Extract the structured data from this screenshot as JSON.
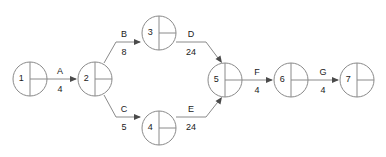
{
  "diagram": {
    "type": "activity-on-arrow-network",
    "colors": {
      "stroke": "#8a8a8a",
      "text": "#1a1a1a",
      "arrow": "#4a4a4a",
      "background": "#ffffff"
    },
    "nodes": [
      {
        "id": "1",
        "label": "1",
        "cx": 30,
        "cy": 79,
        "r": 17
      },
      {
        "id": "2",
        "label": "2",
        "cx": 95,
        "cy": 79,
        "r": 17
      },
      {
        "id": "3",
        "label": "3",
        "cx": 159,
        "cy": 33,
        "r": 17
      },
      {
        "id": "4",
        "label": "4",
        "cx": 159,
        "cy": 128,
        "r": 17
      },
      {
        "id": "5",
        "label": "5",
        "cx": 225,
        "cy": 80,
        "r": 17
      },
      {
        "id": "6",
        "label": "6",
        "cx": 291,
        "cy": 80,
        "r": 17
      },
      {
        "id": "7",
        "label": "7",
        "cx": 357,
        "cy": 80,
        "r": 17
      }
    ],
    "edges": [
      {
        "id": "A",
        "name": "A",
        "weight": "4",
        "from": "1",
        "to": "2",
        "path": "M 47 79 L 76 79",
        "arrow_x": 77,
        "arrow_y": 79,
        "arrow_dir": 0,
        "name_x": 60,
        "name_y": 74,
        "weight_x": 60,
        "weight_y": 92
      },
      {
        "id": "B",
        "name": "B",
        "weight": "8",
        "from": "2",
        "to": "3",
        "path": "M 104 63 L 116 42 L 140 42",
        "arrow_x": 141,
        "arrow_y": 42,
        "arrow_dir": 0,
        "name_x": 124,
        "name_y": 37,
        "weight_x": 124,
        "weight_y": 55
      },
      {
        "id": "C",
        "name": "C",
        "weight": "5",
        "from": "2",
        "to": "4",
        "path": "M 104 95 L 116 117 L 140 117",
        "arrow_x": 141,
        "arrow_y": 117,
        "arrow_dir": 0,
        "name_x": 124,
        "name_y": 112,
        "weight_x": 124,
        "weight_y": 130
      },
      {
        "id": "D",
        "name": "D",
        "weight": "24",
        "from": "3",
        "to": "5",
        "path": "M 176 42 L 206 42 L 221 62",
        "arrow_x": 222,
        "arrow_y": 63,
        "arrow_dir": 55,
        "name_x": 191,
        "name_y": 37,
        "weight_x": 191,
        "weight_y": 55
      },
      {
        "id": "E",
        "name": "E",
        "weight": "24",
        "from": "4",
        "to": "5",
        "path": "M 176 117 L 206 117 L 221 98",
        "arrow_x": 222,
        "arrow_y": 97,
        "arrow_dir": -55,
        "name_x": 191,
        "name_y": 112,
        "weight_x": 191,
        "weight_y": 130
      },
      {
        "id": "F",
        "name": "F",
        "weight": "4",
        "from": "5",
        "to": "6",
        "path": "M 242 80 L 272 80",
        "arrow_x": 273,
        "arrow_y": 80,
        "arrow_dir": 0,
        "name_x": 257,
        "name_y": 75,
        "weight_x": 257,
        "weight_y": 93
      },
      {
        "id": "G",
        "name": "G",
        "weight": "4",
        "from": "6",
        "to": "7",
        "path": "M 308 80 L 338 80",
        "arrow_x": 339,
        "arrow_y": 80,
        "arrow_dir": 0,
        "name_x": 323,
        "name_y": 75,
        "weight_x": 323,
        "weight_y": 93
      }
    ]
  }
}
